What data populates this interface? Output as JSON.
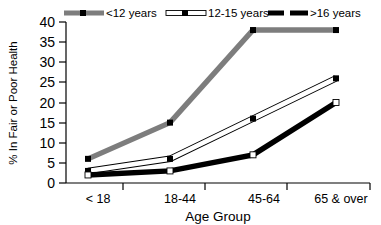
{
  "chart_data": {
    "type": "line",
    "title": "",
    "xlabel": "Age Group",
    "ylabel": "% In Fair or Poor Health",
    "categories": [
      "< 18",
      "18-44",
      "45-64",
      "65 & over"
    ],
    "ylim": [
      0,
      40
    ],
    "ytick_labels": [
      "0",
      "5",
      "10",
      "15",
      "20",
      "25",
      "30",
      "35",
      "40"
    ],
    "ytick_values": [
      0,
      5,
      10,
      15,
      20,
      25,
      30,
      35,
      40
    ],
    "grid": false,
    "legend_position": "top",
    "series": [
      {
        "name": "<12 years",
        "values": [
          6,
          15,
          38,
          38
        ],
        "color": "#7d7d7d",
        "marker": "square-filled",
        "marker_color": "#000000"
      },
      {
        "name": "12-15 years",
        "values": [
          3,
          6,
          16,
          26
        ],
        "color": "#ffffff",
        "marker": "square-filled",
        "marker_color": "#000000"
      },
      {
        "name": ">16 years",
        "values": [
          2,
          3,
          7,
          20
        ],
        "color": "#000000",
        "marker": "square-open",
        "marker_color": "#ffffff"
      }
    ]
  },
  "colors": {
    "axis": "#000000",
    "background": "#ffffff",
    "series_gray": "#7d7d7d",
    "series_white": "#ffffff",
    "series_black": "#000000"
  }
}
